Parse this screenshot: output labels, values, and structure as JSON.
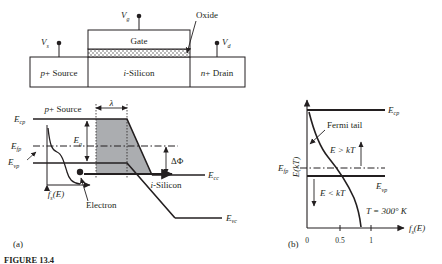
{
  "figure": {
    "caption_id": "FIGURE 13.4",
    "panel_a_label": "(a)",
    "panel_b_label": "(b)"
  },
  "colors": {
    "line": "#231f20",
    "shade_fill": "#a7a9ac",
    "oxide_fill": "#e6e7e8",
    "background": "#ffffff"
  },
  "device": {
    "terminals": [
      {
        "name": "gate-terminal",
        "label_base": "V",
        "label_sub": "g"
      },
      {
        "name": "source-terminal",
        "label_base": "V",
        "label_sub": "s"
      },
      {
        "name": "drain-terminal",
        "label_base": "V",
        "label_sub": "d"
      }
    ],
    "regions": [
      {
        "name": "gate-region",
        "prefix": "",
        "label": "Gate"
      },
      {
        "name": "source-region",
        "prefix": "p",
        "label": "+ Source"
      },
      {
        "name": "channel-region",
        "prefix": "i",
        "label": "-Silicon"
      },
      {
        "name": "drain-region",
        "prefix": "n",
        "label": "+ Drain"
      }
    ],
    "oxide_callout": "Oxide"
  },
  "band_diagram": {
    "energy_levels": [
      {
        "name": "source-conduction-band",
        "base": "E",
        "sub": "cp"
      },
      {
        "name": "source-fermi-level",
        "base": "E",
        "sub": "fp"
      },
      {
        "name": "source-valence-band",
        "base": "E",
        "sub": "vp"
      },
      {
        "name": "channel-conduction-band",
        "base": "E",
        "sub": "cc"
      },
      {
        "name": "channel-valence-band",
        "base": "E",
        "sub": "vc"
      }
    ],
    "annotations": {
      "source_region": {
        "prefix": "p",
        "text": "+ Source"
      },
      "channel_region": {
        "prefix": "i",
        "text": "-Silicon"
      },
      "tunnel_width": "λ",
      "bandgap_base": "E",
      "bandgap_sub": "g",
      "barrier_lowering": "ΔΦ",
      "carrier_label": "Electron",
      "distribution_base": "f",
      "distribution_sub": "s",
      "distribution_arg": "(E)"
    }
  },
  "fermi_plot": {
    "yaxis": {
      "base": "E",
      "paren_open": "(",
      "kt": "kT",
      "paren_close": ")"
    },
    "xaxis": {
      "base": "f",
      "sub": "s",
      "arg": "(E)"
    },
    "xticks": [
      "0",
      "0.5",
      "1"
    ],
    "levels": [
      {
        "name": "conduction-band-level",
        "base": "E",
        "sub": "cp"
      },
      {
        "name": "fermi-level",
        "base": "E",
        "sub": "fp"
      },
      {
        "name": "valence-band-level",
        "base": "E",
        "sub": "vp"
      }
    ],
    "annotations": {
      "tail_label": "Fermi tail",
      "above_kt": "E > kT",
      "below_kt": "E < kT",
      "temperature": "T = 300° K"
    }
  }
}
